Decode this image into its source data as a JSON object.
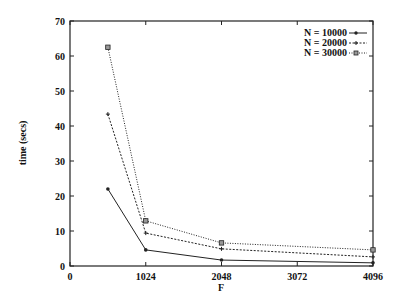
{
  "chart_data": {
    "type": "line",
    "title": "",
    "xlabel": "F",
    "ylabel": "time (secs)",
    "xlim": [
      0,
      4096
    ],
    "ylim": [
      0,
      70
    ],
    "xticks": [
      0,
      1024,
      2048,
      3072,
      4096
    ],
    "yticks": [
      0,
      10,
      20,
      30,
      40,
      50,
      60,
      70
    ],
    "grid": false,
    "legend_position": "upper right",
    "x": [
      512,
      1024,
      2048,
      4096
    ],
    "series": [
      {
        "name": "N = 10000",
        "values": [
          22.0,
          4.6,
          1.7,
          0.9
        ],
        "style": "solid",
        "marker": "dot"
      },
      {
        "name": "N = 20000",
        "values": [
          43.4,
          9.4,
          4.9,
          2.6
        ],
        "style": "dashed",
        "marker": "plus"
      },
      {
        "name": "N = 30000",
        "values": [
          62.5,
          12.9,
          6.6,
          4.6
        ],
        "style": "dotted",
        "marker": "square"
      }
    ]
  },
  "labels": {
    "xlabel": "F",
    "ylabel": "time (secs)",
    "legend": [
      "N = 10000",
      "N = 20000",
      "N = 30000"
    ],
    "xticks": [
      "0",
      "1024",
      "2048",
      "3072",
      "4096"
    ],
    "yticks": [
      "0",
      "10",
      "20",
      "30",
      "40",
      "50",
      "60",
      "70"
    ]
  }
}
